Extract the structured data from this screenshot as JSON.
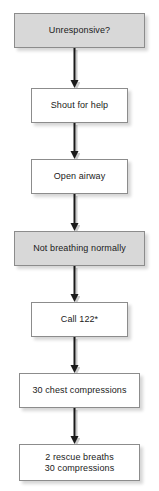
{
  "diagram": {
    "background_color": "#ffffff",
    "box_fill_gray": "#d8d8d8",
    "box_fill_white": "#ffffff",
    "box_border_color": "#8c8c8c",
    "arrow_color": "#1a1a1a",
    "nodes": [
      {
        "id": "unresponsive",
        "label": "Unresponsive?",
        "fill": "gray",
        "x": 14,
        "y": 13,
        "width": 131,
        "height": 35
      },
      {
        "id": "shout-for-help",
        "label": "Shout for help",
        "fill": "white",
        "x": 31,
        "y": 88,
        "width": 97,
        "height": 35
      },
      {
        "id": "open-airway",
        "label": "Open airway",
        "fill": "white",
        "x": 31,
        "y": 159,
        "width": 97,
        "height": 35
      },
      {
        "id": "not-breathing-normally",
        "label": "Not breathing normally",
        "fill": "gray",
        "x": 14,
        "y": 231,
        "width": 131,
        "height": 35
      },
      {
        "id": "call-122",
        "label": "Call 122*",
        "fill": "white",
        "x": 31,
        "y": 302,
        "width": 97,
        "height": 35
      },
      {
        "id": "chest-compressions",
        "label": "30 chest compressions",
        "fill": "white",
        "x": 19,
        "y": 373,
        "width": 121,
        "height": 35
      },
      {
        "id": "rescue-breaths",
        "label": "2 rescue breaths\n30 compressions",
        "fill": "white",
        "x": 19,
        "y": 444,
        "width": 121,
        "height": 37
      }
    ],
    "connectors": [
      {
        "id": "arrow-1",
        "from": "unresponsive",
        "to": "shout-for-help",
        "x": 74,
        "y": 48,
        "length": 40
      },
      {
        "id": "arrow-2",
        "from": "shout-for-help",
        "to": "open-airway",
        "x": 74,
        "y": 123,
        "length": 36
      },
      {
        "id": "arrow-3",
        "from": "open-airway",
        "to": "not-breathing-normally",
        "x": 74,
        "y": 194,
        "length": 37
      },
      {
        "id": "arrow-4",
        "from": "not-breathing-normally",
        "to": "call-122",
        "x": 74,
        "y": 266,
        "length": 36
      },
      {
        "id": "arrow-5",
        "from": "call-122",
        "to": "chest-compressions",
        "x": 74,
        "y": 337,
        "length": 36
      },
      {
        "id": "arrow-6",
        "from": "chest-compressions",
        "to": "rescue-breaths",
        "x": 74,
        "y": 408,
        "length": 36
      }
    ]
  }
}
